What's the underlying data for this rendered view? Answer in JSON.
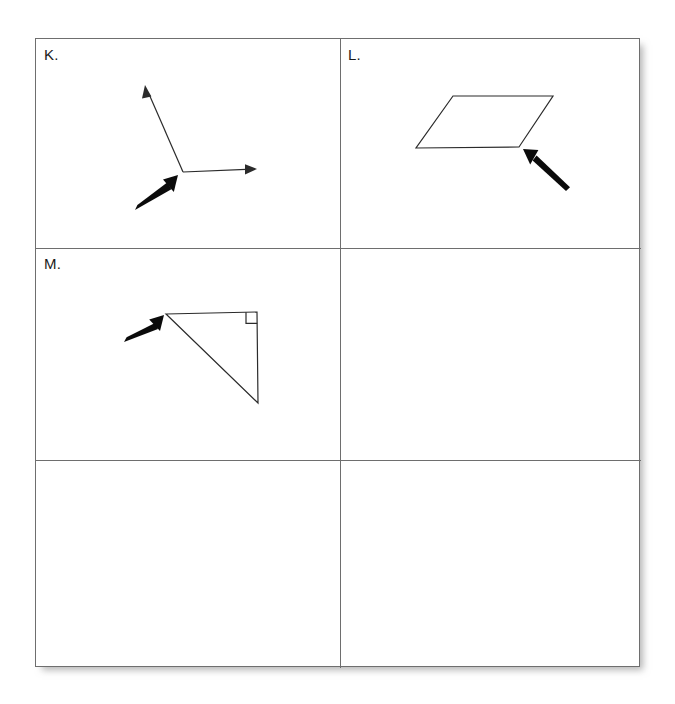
{
  "worksheet": {
    "title": "Geometry figures worksheet",
    "background_color": "#ffffff",
    "border_color": "#6e6e6e",
    "ink_color": "#2b2b2b",
    "pointer_color": "#0b0b0b",
    "columns": 2,
    "rows": 3
  },
  "cells": [
    {
      "id": "cell-k",
      "label": "K.",
      "row": 0,
      "column": 0,
      "figure": "angle-with-two-rays",
      "figure_description": "An angle formed by two rays meeting at a common vertex, with a bold arrow pointing at the vertex.",
      "pointer_target": "vertex"
    },
    {
      "id": "cell-l",
      "label": "L.",
      "row": 0,
      "column": 1,
      "figure": "parallelogram",
      "figure_description": "A parallelogram with a bold arrow pointing at its bottom-right vertex.",
      "pointer_target": "bottom-right vertex"
    },
    {
      "id": "cell-m",
      "label": "M.",
      "row": 1,
      "column": 0,
      "figure": "right-triangle",
      "figure_description": "A right triangle with a right-angle square marker at the top-right corner and a bold arrow pointing at the top-left vertex.",
      "pointer_target": "top-left vertex"
    },
    {
      "id": "cell-blank-r1c1",
      "label": "",
      "row": 1,
      "column": 1,
      "figure": "none",
      "figure_description": "Empty cell.",
      "pointer_target": ""
    },
    {
      "id": "cell-blank-r2c0",
      "label": "",
      "row": 2,
      "column": 0,
      "figure": "none",
      "figure_description": "Empty cell.",
      "pointer_target": ""
    },
    {
      "id": "cell-blank-r2c1",
      "label": "",
      "row": 2,
      "column": 1,
      "figure": "none",
      "figure_description": "Empty cell.",
      "pointer_target": ""
    }
  ],
  "geometry": {
    "angle_k": {
      "vertex": [
        147,
        133
      ],
      "ray_up_tip": [
        109,
        46
      ],
      "ray_right_tip": [
        221,
        130
      ],
      "pointer_tail": [
        99,
        171
      ],
      "pointer_tip": [
        142,
        136
      ]
    },
    "parallelogram_l": {
      "top_left": [
        113,
        57
      ],
      "top_right": [
        213,
        57
      ],
      "bottom_right": [
        179,
        108
      ],
      "bottom_left": [
        76,
        109
      ],
      "pointer_tail": [
        226,
        152
      ],
      "pointer_tip": [
        183,
        110
      ]
    },
    "triangle_m": {
      "top_left": [
        130,
        66
      ],
      "top_right": [
        221,
        64
      ],
      "bottom_right": [
        222,
        155
      ],
      "right_angle_marker_size": 11,
      "pointer_tail": [
        88,
        94
      ],
      "pointer_tip": [
        128,
        67
      ]
    }
  }
}
